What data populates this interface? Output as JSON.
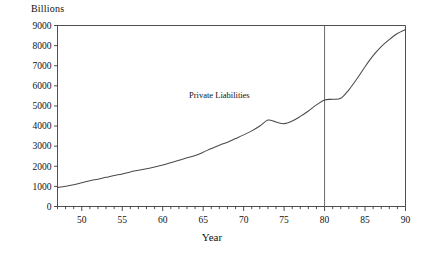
{
  "chart_data": {
    "type": "line",
    "title": "",
    "ylabel": "Billions",
    "xlabel": "Year",
    "grid": false,
    "legend_position": "inline-annotation",
    "xlim": [
      47,
      90
    ],
    "ylim": [
      0,
      9000
    ],
    "y_ticks": [
      0,
      1000,
      2000,
      3000,
      4000,
      5000,
      6000,
      7000,
      8000,
      9000
    ],
    "x_ticks_major": [
      50,
      55,
      60,
      65,
      70,
      75,
      80,
      85,
      90
    ],
    "x_minor_tick_step": 1,
    "annotations": [
      {
        "text": "Private Liabilities",
        "x": 67,
        "y": 5400
      }
    ],
    "reference_lines": [
      {
        "orientation": "vertical",
        "x": 80
      }
    ],
    "series": [
      {
        "name": "Private Liabilities",
        "x": [
          47,
          48,
          49,
          50,
          51,
          52,
          53,
          54,
          55,
          56,
          57,
          58,
          59,
          60,
          61,
          62,
          63,
          64,
          65,
          66,
          67,
          68,
          69,
          70,
          71,
          72,
          73,
          74,
          75,
          76,
          77,
          78,
          79,
          80,
          81,
          82,
          83,
          84,
          85,
          86,
          87,
          88,
          89,
          90
        ],
        "values": [
          950,
          1010,
          1080,
          1180,
          1280,
          1360,
          1450,
          1540,
          1620,
          1720,
          1800,
          1880,
          1960,
          2060,
          2180,
          2300,
          2420,
          2530,
          2700,
          2880,
          3050,
          3200,
          3380,
          3560,
          3760,
          4000,
          4300,
          4200,
          4120,
          4250,
          4480,
          4750,
          5050,
          5300,
          5330,
          5380,
          5800,
          6350,
          6950,
          7500,
          7950,
          8300,
          8600,
          8800
        ]
      }
    ]
  }
}
